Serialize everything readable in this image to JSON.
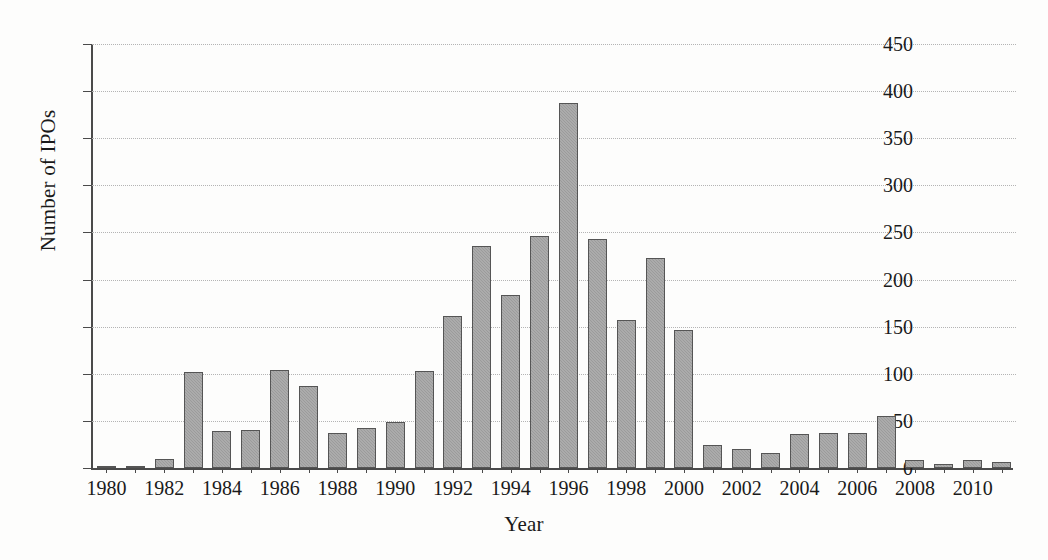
{
  "chart_data": {
    "type": "bar",
    "title": "",
    "xlabel": "Year",
    "ylabel": "Number of IPOs",
    "ylim": [
      0,
      450
    ],
    "ytick_step": 50,
    "yticks": [
      0,
      50,
      100,
      150,
      200,
      250,
      300,
      350,
      400,
      450
    ],
    "xtick_labels": [
      "1980",
      "1982",
      "1984",
      "1986",
      "1988",
      "1990",
      "1992",
      "1994",
      "1996",
      "1998",
      "2000",
      "2002",
      "2004",
      "2006",
      "2008",
      "2010"
    ],
    "xtick_step": 2,
    "grid": "horizontal-dotted",
    "legend": null,
    "bar_color": "#9b9b9b",
    "bar_edge_color": "#555555",
    "grid_color": "#b4b4b4",
    "axis_color": "#4a4a4a",
    "categories": [
      "1980",
      "1981",
      "1982",
      "1983",
      "1984",
      "1985",
      "1986",
      "1987",
      "1988",
      "1989",
      "1990",
      "1991",
      "1992",
      "1993",
      "1994",
      "1995",
      "1996",
      "1997",
      "1998",
      "1999",
      "2000",
      "2001",
      "2002",
      "2003",
      "2004",
      "2005",
      "2006",
      "2007",
      "2008",
      "2009",
      "2010",
      "2011"
    ],
    "values": [
      1,
      1,
      10,
      102,
      39,
      40,
      104,
      87,
      37,
      42,
      49,
      103,
      161,
      236,
      184,
      246,
      387,
      243,
      157,
      223,
      147,
      24,
      20,
      16,
      36,
      37,
      37,
      55,
      8,
      4,
      8,
      6
    ]
  }
}
